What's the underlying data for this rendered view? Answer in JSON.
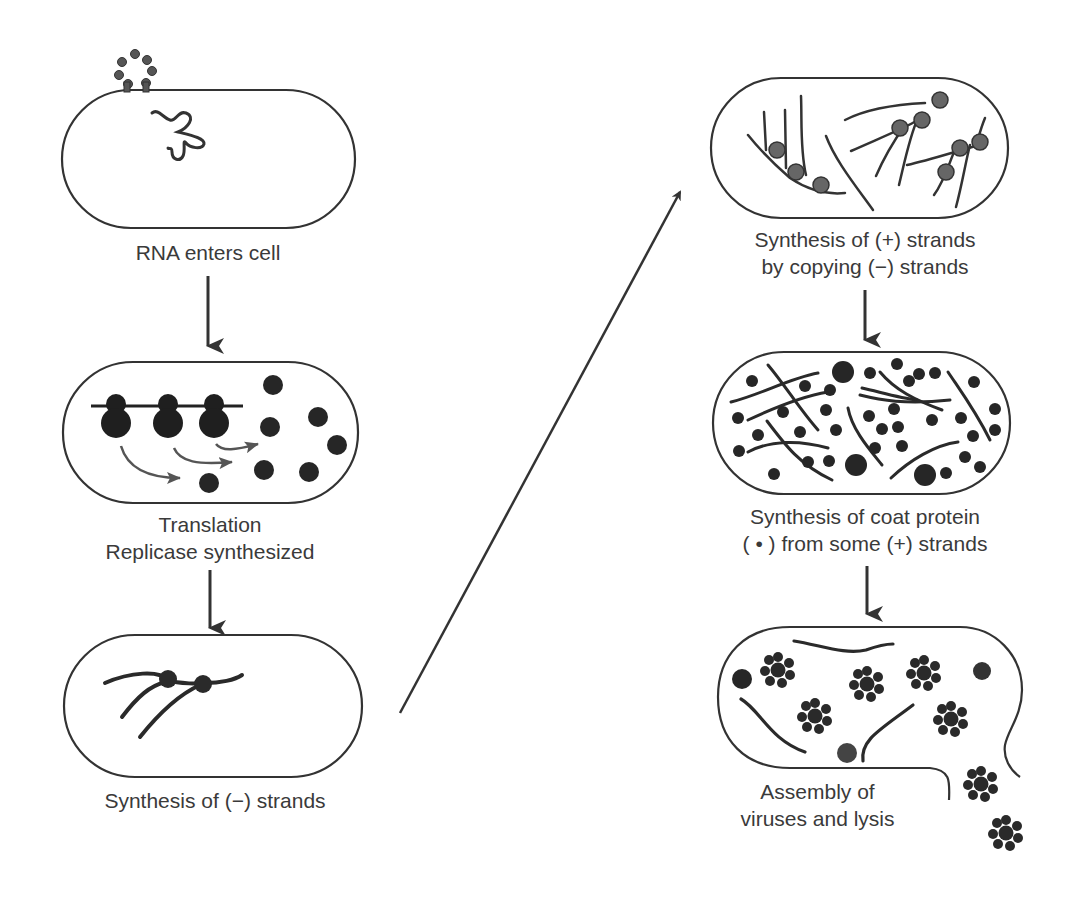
{
  "colors": {
    "stroke": "#333333",
    "fill": "#2a2a2a",
    "text": "#3a3a3a",
    "background": "#ffffff"
  },
  "steps": [
    {
      "id": "rna-enters",
      "label_lines": [
        "RNA enters cell"
      ]
    },
    {
      "id": "translation",
      "label_lines": [
        "Translation",
        "Replicase synthesized"
      ]
    },
    {
      "id": "minus-strands",
      "label_lines": [
        "Synthesis of (−) strands"
      ]
    },
    {
      "id": "plus-strands",
      "label_lines": [
        "Synthesis of (+) strands",
        "by copying (−) strands"
      ]
    },
    {
      "id": "coat-protein",
      "label_lines": [
        "Synthesis of coat protein",
        "( • ) from some (+) strands"
      ]
    },
    {
      "id": "assembly",
      "label_lines": [
        "Assembly of",
        "viruses and lysis"
      ]
    }
  ],
  "icons": {
    "arrow_down": "down-arrow-icon",
    "arrow_diagonal": "diagonal-arrow-icon",
    "cell": "bacterial-cell-icon",
    "virus": "virus-particle-icon",
    "ribosome": "ribosome-icon",
    "rna_strand": "rna-strand-icon"
  }
}
